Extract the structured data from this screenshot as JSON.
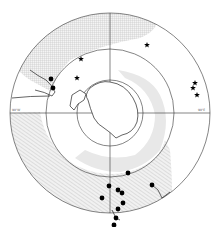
{
  "figure": {
    "type": "polar-stereographic map",
    "region": "Antarctica / Southern Ocean",
    "colors": {
      "background": "#ffffff",
      "hatch": "#bdbdbd",
      "shelf": "#e3e3e3",
      "line": "#333333",
      "marker": "#000000"
    }
  },
  "labels": {
    "left_meridian": "90°W",
    "right_meridian": "90°E",
    "top_meridian": "180°",
    "bottom_meridian": "0°"
  },
  "markers": {
    "stars": [
      {
        "x": 81,
        "y": 59
      },
      {
        "x": 77,
        "y": 78
      },
      {
        "x": 147,
        "y": 45
      },
      {
        "x": 195,
        "y": 83
      },
      {
        "x": 193,
        "y": 88
      },
      {
        "x": 197,
        "y": 95
      }
    ],
    "dots": [
      {
        "x": 51,
        "y": 79
      },
      {
        "x": 53,
        "y": 88
      },
      {
        "x": 128,
        "y": 173
      },
      {
        "x": 109,
        "y": 186
      },
      {
        "x": 118,
        "y": 190
      },
      {
        "x": 122,
        "y": 193
      },
      {
        "x": 123,
        "y": 203
      },
      {
        "x": 118,
        "y": 209
      },
      {
        "x": 116,
        "y": 218
      },
      {
        "x": 114,
        "y": 225
      },
      {
        "x": 102,
        "y": 198
      },
      {
        "x": 152,
        "y": 185
      }
    ]
  }
}
